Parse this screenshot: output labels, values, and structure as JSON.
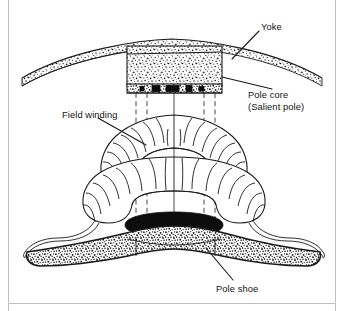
{
  "figure": {
    "type": "technical-line-drawing",
    "width": 344,
    "height": 311,
    "background_color": "#ffffff",
    "ink_color": "#1a1a1a",
    "border_color": "#bfbfbf"
  },
  "labels": {
    "yoke": "Yoke",
    "pole_core_line1": "Pole core",
    "pole_core_line2": "(Salient pole)",
    "field_winding": "Field winding",
    "pole_shoe": "Pole shoe"
  },
  "parts": [
    {
      "id": "yoke",
      "name": "Yoke",
      "texture": "stipple",
      "description": "Curved arc band across the top of the figure"
    },
    {
      "id": "pole-core",
      "name": "Pole core (Salient pole)",
      "texture": "stipple",
      "description": "Rectangular stippled block below the yoke"
    },
    {
      "id": "field-winding",
      "name": "Field winding",
      "texture": "outline",
      "description": "Two stacked coil layers wrapped around the pole core with lead wires exiting both sides"
    },
    {
      "id": "pole-shoe",
      "name": "Pole shoe",
      "texture": "stipple-with-black-band",
      "description": "Wide curved winged shoe at the bottom with a solid black upper band"
    }
  ]
}
